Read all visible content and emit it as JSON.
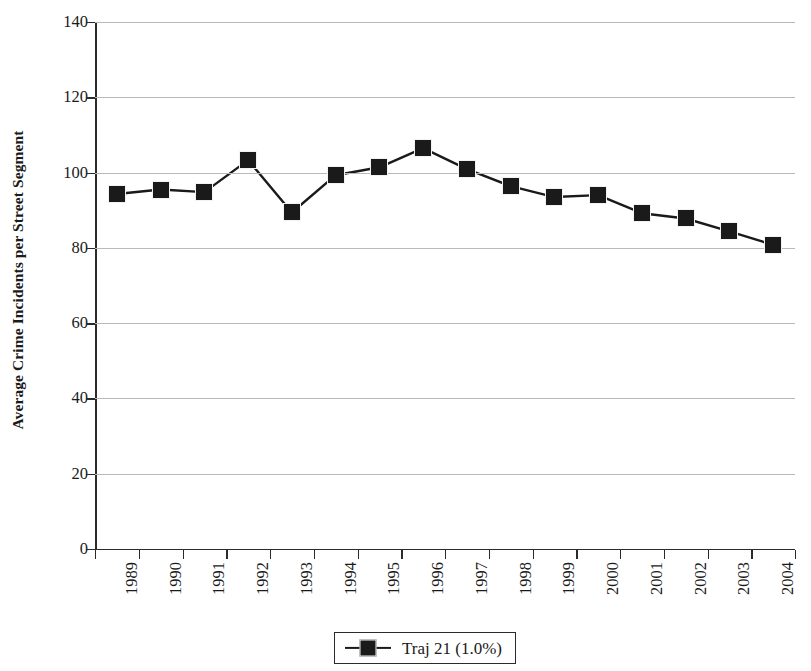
{
  "chart_data": {
    "type": "line",
    "title": "",
    "subtitle": "",
    "xlabel": "",
    "ylabel": "Average Crime Incidents per Street Segment",
    "categories": [
      "1989",
      "1990",
      "1991",
      "1992",
      "1993",
      "1994",
      "1995",
      "1996",
      "1997",
      "1998",
      "1999",
      "2000",
      "2001",
      "2002",
      "2003",
      "2004"
    ],
    "series": [
      {
        "name": "Traj 21 (1.0%)",
        "values": [
          94.3,
          95.5,
          94.8,
          103.3,
          89.4,
          99.3,
          101.4,
          106.5,
          100.9,
          96.4,
          93.5,
          94.0,
          89.2,
          87.8,
          84.4,
          80.8
        ],
        "marker": "filled-square",
        "color": "#1a1a1a"
      }
    ],
    "ylim": [
      0,
      140
    ],
    "yticks": [
      0,
      20,
      40,
      60,
      80,
      100,
      120,
      140
    ],
    "ytick_labels": [
      "0",
      "20",
      "40",
      "60",
      "80",
      "100",
      "120",
      "140"
    ],
    "grid": true,
    "grid_axis": "y",
    "legend_position": "bottom-center",
    "colors": {
      "series": "#1a1a1a",
      "gridline": "#b9b9b9",
      "axis": "#2b2b2b",
      "background": "#ffffff"
    }
  },
  "legend": {
    "entries": [
      {
        "label": "Traj 21 (1.0%)",
        "symbol": "line-with-square-marker"
      }
    ]
  }
}
